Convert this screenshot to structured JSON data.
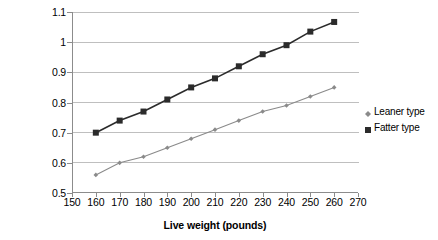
{
  "chart_data": {
    "type": "line",
    "title": "",
    "xlabel": "Live weight (pounds)",
    "ylabel": "Backfat (in.)",
    "xlim": [
      150,
      270
    ],
    "ylim": [
      0.5,
      1.1
    ],
    "xticks": [
      150,
      160,
      170,
      180,
      190,
      200,
      210,
      220,
      230,
      240,
      250,
      260,
      270
    ],
    "yticks": [
      0.5,
      0.6,
      0.7,
      0.8,
      0.9,
      1,
      1.1
    ],
    "xtick_labels": [
      "150",
      "160",
      "170",
      "180",
      "190",
      "200",
      "210",
      "220",
      "230",
      "240",
      "250",
      "260",
      "270"
    ],
    "ytick_labels": [
      "0.5",
      "0.6",
      "0.7",
      "0.8",
      "0.9",
      "1",
      "1.1"
    ],
    "grid": "horizontal",
    "legend_position": "right",
    "x": [
      160,
      170,
      180,
      190,
      200,
      210,
      220,
      230,
      240,
      250,
      260
    ],
    "series": [
      {
        "name": "Leaner type",
        "marker": "diamond",
        "color": "#8a8a8a",
        "values": [
          0.56,
          0.6,
          0.62,
          0.65,
          0.68,
          0.71,
          0.74,
          0.77,
          0.79,
          0.82,
          0.85
        ]
      },
      {
        "name": "Fatter type",
        "marker": "square",
        "color": "#2b2b2b",
        "values": [
          0.7,
          0.74,
          0.77,
          0.81,
          0.85,
          0.88,
          0.92,
          0.96,
          0.99,
          1.035,
          1.067
        ]
      }
    ]
  },
  "legend": {
    "items": [
      {
        "label": "Leaner type",
        "marker": "diamond-marker-icon",
        "color": "#8a8a8a"
      },
      {
        "label": "Fatter type",
        "marker": "square-marker-icon",
        "color": "#2b2b2b"
      }
    ]
  },
  "colors": {
    "gridline": "#bfbfbf",
    "axis": "#8c8c8c",
    "background": "#ffffff",
    "leaner": "#8a8a8a",
    "fatter": "#2b2b2b"
  }
}
